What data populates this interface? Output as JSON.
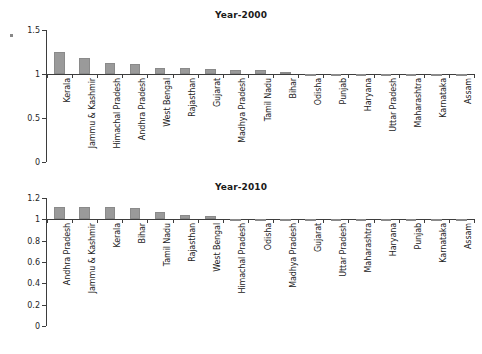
{
  "figure": {
    "background": "#ffffff",
    "bar_color": "#9a9a9a",
    "axis_color": "#3d3d3d",
    "text_color": "#222222"
  },
  "chart_data": [
    {
      "type": "bar",
      "title": "Year-2000",
      "xlabel": "",
      "ylabel": "",
      "ylim": [
        0,
        1.5
      ],
      "yticks": [
        "0",
        "0.5",
        "1",
        "1.5"
      ],
      "ytick_values": [
        0,
        0.5,
        1,
        1.5
      ],
      "grid": false,
      "legend": "none",
      "baseline": 1,
      "categories": [
        "Kerala",
        "Jammu & Kashmir",
        "Himachal Pradesh",
        "Andhra Pradesh",
        "West Bengal",
        "Rajasthan",
        "Gujarat",
        "Madhya Pradesh",
        "Tamil Nadu",
        "Bihar",
        "Odisha",
        "Punjab",
        "Haryana",
        "Uttar Pradesh",
        "Maharashtra",
        "Karnataka",
        "Assam"
      ],
      "values": [
        1.25,
        1.18,
        1.13,
        1.11,
        1.07,
        1.07,
        1.06,
        1.05,
        1.04,
        1.02,
        0.99,
        0.99,
        0.99,
        0.99,
        0.99,
        0.99,
        0.99
      ]
    },
    {
      "type": "bar",
      "title": "Year-2010",
      "xlabel": "",
      "ylabel": "",
      "ylim": [
        0,
        1.2
      ],
      "yticks": [
        "0",
        "0.2",
        "0.4",
        "0.6",
        "0.8",
        "1",
        "1.2"
      ],
      "ytick_values": [
        0,
        0.2,
        0.4,
        0.6,
        0.8,
        1,
        1.2
      ],
      "grid": false,
      "legend": "none",
      "baseline": 1,
      "categories": [
        "Andhra Pradesh",
        "Jammu & Kashmir",
        "Kerala",
        "Bihar",
        "Tamil Nadu",
        "Rajasthan",
        "West Bengal",
        "Himachal Pradesh",
        "Odisha",
        "Madhya Pradesh",
        "Gujarat",
        "Uttar Pradesh",
        "Maharashtra",
        "Haryana",
        "Punjab",
        "Karnataka",
        "Assam"
      ],
      "values": [
        1.12,
        1.12,
        1.115,
        1.11,
        1.07,
        1.04,
        1.035,
        1.005,
        0.985,
        0.995,
        0.995,
        0.995,
        0.995,
        0.995,
        0.995,
        0.995,
        0.995
      ]
    }
  ]
}
